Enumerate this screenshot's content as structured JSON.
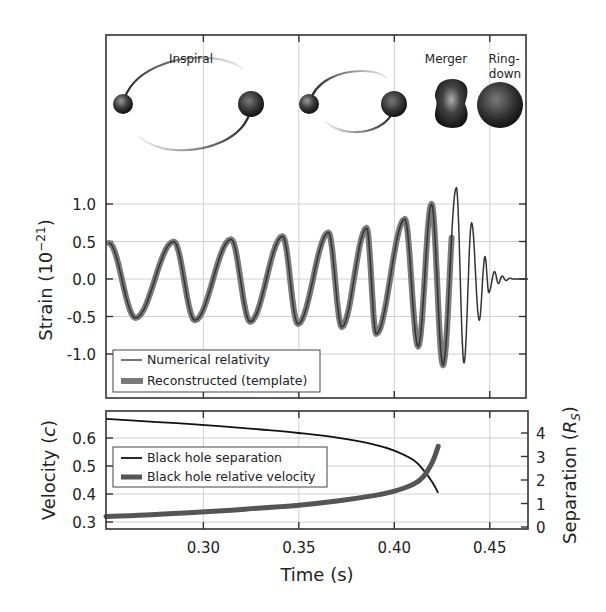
{
  "chart_data": [
    {
      "type": "line",
      "title": "",
      "panel": "strain",
      "xlabel": "",
      "ylabel": "Strain (10^-21)",
      "ylabel_main": "Strain (10",
      "ylabel_sup": "−21",
      "ylabel_close": ")",
      "xlim": [
        0.249,
        0.4695
      ],
      "ylim": [
        -1.34,
        2.27
      ],
      "yticks": [
        1.0,
        0.5,
        0.0,
        -0.5,
        -1.0
      ],
      "ytick_labels": [
        "1.0",
        "0.5",
        "0.0",
        "-0.5",
        "-1.0"
      ],
      "grid": true,
      "phase_annotations": [
        {
          "text": "Inspiral",
          "x": 0.291,
          "line2": ""
        },
        {
          "text": "Merger",
          "x": 0.4175,
          "line2": ""
        },
        {
          "text": "Ring-",
          "x": 0.4445,
          "line2": "down"
        }
      ],
      "waveform_extrema": {
        "t": [
          0.2505,
          0.2645,
          0.2845,
          0.2955,
          0.3145,
          0.3245,
          0.3415,
          0.3495,
          0.3655,
          0.3725,
          0.3855,
          0.3905,
          0.4055,
          0.4125,
          0.4195,
          0.4255,
          0.4325,
          0.4365,
          0.4405,
          0.4445,
          0.4475,
          0.4495,
          0.4525,
          0.4545,
          0.4565,
          0.4585,
          0.4605,
          0.4625,
          0.47
        ],
        "strain": [
          0.48,
          -0.52,
          0.5,
          -0.55,
          0.53,
          -0.57,
          0.57,
          -0.6,
          0.62,
          -0.64,
          0.68,
          -0.73,
          0.8,
          -0.9,
          1.0,
          -1.15,
          1.22,
          -1.12,
          0.75,
          -0.55,
          0.3,
          -0.18,
          0.1,
          -0.06,
          0.04,
          -0.02,
          0.01,
          0.0,
          0.0
        ]
      },
      "legend": {
        "position": "lower left",
        "entries": [
          {
            "label": "Numerical relativity",
            "style": "thin dark line"
          },
          {
            "label": "Reconstructed (template)",
            "style": "thick gray band"
          }
        ]
      },
      "series": [
        {
          "name": "Numerical relativity",
          "color": "#333333",
          "width": 1.5
        },
        {
          "name": "Reconstructed (template)",
          "color": "#777777",
          "width": 6,
          "end_t": 0.43
        }
      ]
    },
    {
      "type": "line",
      "panel": "orbit",
      "xlabel": "Time (s)",
      "ylabel_left": "Velocity (c)",
      "ylabel_left_main": "Velocity (",
      "ylabel_left_ital": "c",
      "ylabel_left_close": ")",
      "ylabel_right": "Separation (R_S)",
      "ylabel_right_main": "Separation (",
      "ylabel_right_ital": "R",
      "ylabel_right_sub": "S",
      "ylabel_right_close": ")",
      "xlim": [
        0.249,
        0.4695
      ],
      "xticks": [
        0.3,
        0.35,
        0.4,
        0.45
      ],
      "xtick_labels": [
        "0.30",
        "0.35",
        "0.40",
        "0.45"
      ],
      "ylim_left": [
        0.272,
        0.685
      ],
      "yticks_left": [
        0.6,
        0.5,
        0.4,
        0.3
      ],
      "ytick_labels_left": [
        "0.6",
        "0.5",
        "0.4",
        "0.3"
      ],
      "ylim_right": [
        -0.1,
        4.9
      ],
      "yticks_right": [
        4,
        3,
        2,
        1,
        0
      ],
      "ytick_labels_right": [
        "4",
        "3",
        "2",
        "1",
        "0"
      ],
      "grid": true,
      "legend": {
        "position": "center left",
        "entries": [
          {
            "label": "Black hole separation",
            "style": "thin black line"
          },
          {
            "label": "Black hole relative velocity",
            "style": "thick gray line"
          }
        ]
      },
      "series": [
        {
          "name": "Black hole separation",
          "axis": "right",
          "color": "#111111",
          "width": 1.8,
          "t": [
            0.249,
            0.27,
            0.29,
            0.31,
            0.33,
            0.35,
            0.37,
            0.39,
            0.4,
            0.41,
            0.415,
            0.42,
            0.423
          ],
          "values": [
            4.6,
            4.5,
            4.4,
            4.28,
            4.15,
            4.0,
            3.8,
            3.5,
            3.25,
            2.85,
            2.45,
            1.9,
            1.45
          ]
        },
        {
          "name": "Black hole relative velocity",
          "axis": "left",
          "color": "#555555",
          "width": 5,
          "t": [
            0.249,
            0.27,
            0.29,
            0.31,
            0.33,
            0.35,
            0.37,
            0.39,
            0.4,
            0.41,
            0.415,
            0.42,
            0.423
          ],
          "values": [
            0.32,
            0.325,
            0.332,
            0.34,
            0.35,
            0.36,
            0.375,
            0.395,
            0.41,
            0.435,
            0.46,
            0.515,
            0.57
          ]
        }
      ]
    }
  ],
  "legend_top": {
    "item1": "Numerical relativity",
    "item2": "Reconstructed (template)"
  },
  "legend_bottom": {
    "item1": "Black hole separation",
    "item2": "Black hole relative velocity"
  },
  "colors": {
    "frame": "#333333",
    "grid": "#d0d0d0",
    "nr_line": "#333333",
    "template_band": "#7a7a7a",
    "separation": "#111111",
    "velocity": "#555555",
    "black_hole_dark": "#1a1a1a",
    "black_hole_light": "#8a8a8a"
  }
}
